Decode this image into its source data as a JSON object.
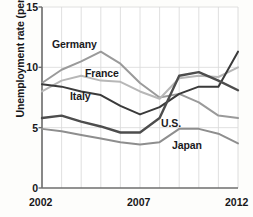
{
  "chart_data": {
    "type": "line",
    "title": "",
    "xlabel": "",
    "ylabel": "Unemployment rate (percent)",
    "ylim": [
      0,
      15
    ],
    "xlim": [
      2002,
      2012
    ],
    "yticks": [
      "15",
      "10",
      "5",
      "0"
    ],
    "ytick_values": [
      15,
      10,
      5,
      0
    ],
    "xticks": [
      "2002",
      "2007",
      "2012"
    ],
    "xtick_values": [
      2002,
      2007,
      2012
    ],
    "grid": "vertical-yearly-plus-horizontal-at-ticks",
    "legend": "inline-labels",
    "x": [
      2002,
      2003,
      2004,
      2005,
      2006,
      2007,
      2008,
      2009,
      2010,
      2011,
      2012
    ],
    "series": [
      {
        "name": "Germany",
        "color": "#9a9a9a",
        "label": "Germany",
        "values": [
          8.7,
          9.8,
          10.5,
          11.3,
          10.3,
          8.7,
          7.5,
          7.8,
          7.1,
          6.0,
          5.8
        ]
      },
      {
        "name": "France",
        "color": "#b7b7b7",
        "label": "France",
        "values": [
          8.0,
          8.9,
          9.3,
          8.9,
          8.8,
          8.0,
          7.4,
          9.1,
          9.3,
          9.2,
          10.0
        ]
      },
      {
        "name": "Italy",
        "color": "#3a3a3a",
        "label": "Italy",
        "values": [
          8.6,
          8.4,
          8.0,
          7.7,
          6.8,
          6.1,
          6.7,
          7.8,
          8.4,
          8.4,
          11.3
        ]
      },
      {
        "name": "U.S.",
        "color": "#4d4d4d",
        "label": "U.S.",
        "values": [
          5.8,
          6.0,
          5.5,
          5.1,
          4.6,
          4.6,
          5.8,
          9.3,
          9.6,
          8.9,
          8.1
        ]
      },
      {
        "name": "Japan",
        "color": "#8e8e8e",
        "label": "Japan",
        "values": [
          4.9,
          4.7,
          4.4,
          4.1,
          3.8,
          3.6,
          3.8,
          4.9,
          4.9,
          4.5,
          3.7
        ]
      }
    ]
  },
  "axis": {
    "ylabel_text": "Unemployment rate (percent)",
    "ytick_0": "15",
    "ytick_1": "10",
    "ytick_2": "5",
    "ytick_3": "0",
    "xtick_0": "2002",
    "xtick_1": "2007",
    "xtick_2": "2012"
  },
  "labels": {
    "germany": "Germany",
    "france": "France",
    "italy": "Italy",
    "us": "U.S.",
    "japan": "Japan"
  },
  "colors": {
    "germany": "#9a9a9a",
    "france": "#b7b7b7",
    "italy": "#3a3a3a",
    "us": "#4d4d4d",
    "japan": "#8e8e8e",
    "axis": "#6e6e6e",
    "grid": "#d8d8d8",
    "background": "#fdfdfb",
    "text": "#17171a"
  }
}
